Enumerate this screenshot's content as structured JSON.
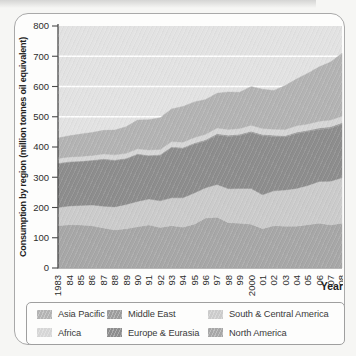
{
  "card": {
    "background": "#fdfdfc",
    "border_color": "#a9a9a9"
  },
  "chart_data": {
    "type": "area",
    "stacked": true,
    "title": "",
    "ylabel": "Consumption by region (million tonnes oil equivalent)",
    "xlabel": "Year",
    "ylim": [
      0,
      800
    ],
    "yticks": [
      0,
      100,
      200,
      300,
      400,
      500,
      600,
      700,
      800
    ],
    "grid": "horizontal white lines every 100, drawn under the areas",
    "legend_position": "bottom",
    "plot_background": "#e2e2e2",
    "grid_color": "#ffffff",
    "axis_color": "#4a4a4a",
    "tick_label_color": "#2d2d2d",
    "categories": [
      "1983",
      "84",
      "85",
      "86",
      "87",
      "88",
      "89",
      "90",
      "91",
      "92",
      "93",
      "94",
      "95",
      "96",
      "97",
      "98",
      "99",
      "2000",
      "01",
      "02",
      "03",
      "04",
      "05",
      "06",
      "07",
      "08"
    ],
    "series": [
      {
        "name": "North America",
        "color": "#a7a7a7",
        "values": [
          140,
          143,
          142,
          140,
          132,
          126,
          130,
          136,
          142,
          134,
          140,
          135,
          145,
          165,
          168,
          150,
          148,
          145,
          130,
          140,
          138,
          138,
          143,
          148,
          142,
          148
        ]
      },
      {
        "name": "South & Central America",
        "color": "#cbcbcb",
        "values": [
          60,
          62,
          65,
          68,
          72,
          76,
          80,
          84,
          86,
          88,
          92,
          97,
          103,
          100,
          108,
          112,
          115,
          118,
          112,
          115,
          120,
          125,
          130,
          138,
          145,
          150
        ]
      },
      {
        "name": "Europe & Eurasia",
        "color": "#8d8d8d",
        "values": [
          145,
          145,
          145,
          147,
          154,
          153,
          150,
          155,
          142,
          150,
          166,
          163,
          162,
          155,
          164,
          173,
          175,
          185,
          195,
          180,
          175,
          182,
          178,
          172,
          175,
          177
        ]
      },
      {
        "name": "Middle East",
        "color": "#9c9c9c",
        "values": [
          2,
          2,
          2,
          2,
          3,
          3,
          3,
          3,
          3,
          3,
          3,
          3,
          3,
          4,
          4,
          4,
          4,
          4,
          4,
          4,
          4,
          4,
          4,
          5,
          5,
          5
        ]
      },
      {
        "name": "Africa",
        "color": "#d6d6d6",
        "values": [
          15,
          15,
          15,
          15,
          16,
          16,
          16,
          16,
          17,
          17,
          17,
          18,
          18,
          18,
          19,
          19,
          19,
          20,
          20,
          20,
          21,
          21,
          21,
          22,
          22,
          22
        ]
      },
      {
        "name": "Asia Pacific",
        "color": "#b3b3b3",
        "values": [
          68,
          70,
          74,
          76,
          78,
          82,
          88,
          95,
          100,
          105,
          108,
          118,
          118,
          115,
          115,
          124,
          120,
          128,
          130,
          128,
          145,
          155,
          168,
          180,
          192,
          208
        ]
      }
    ]
  },
  "legend": {
    "items": [
      {
        "label": "Asia Pacific",
        "color": "#b3b3b3"
      },
      {
        "label": "Africa",
        "color": "#d6d6d6"
      },
      {
        "label": "Middle East",
        "color": "#9c9c9c"
      },
      {
        "label": "Europe & Eurasia",
        "color": "#8d8d8d"
      },
      {
        "label": "South & Central America",
        "color": "#cbcbcb"
      },
      {
        "label": "North America",
        "color": "#a7a7a7"
      }
    ]
  }
}
